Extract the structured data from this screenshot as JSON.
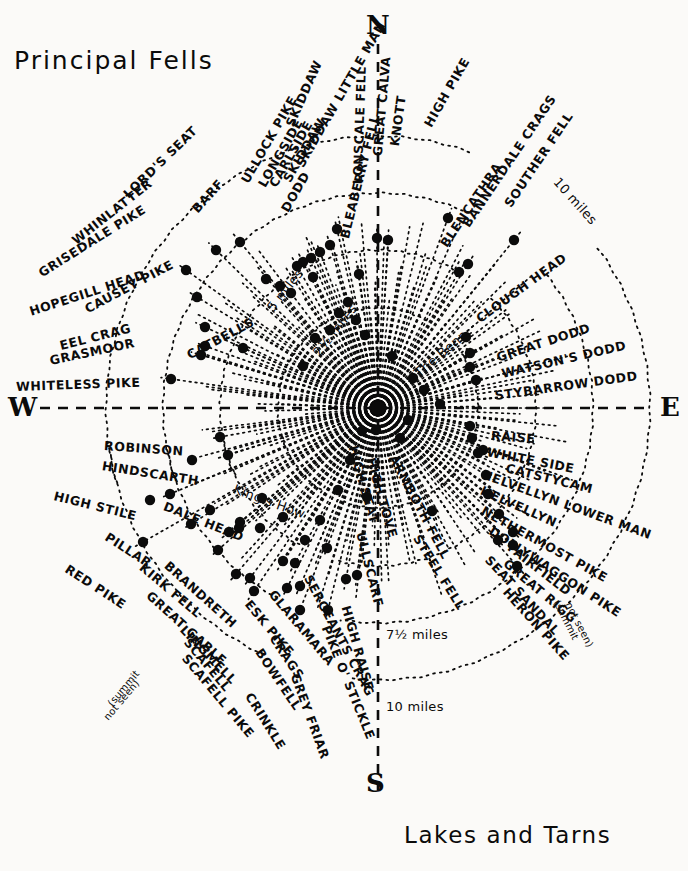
{
  "page": {
    "title": "Principal Fells",
    "caption": "Lakes and Tarns",
    "bg_color": "#fbfaf8",
    "ink_color": "#0b0b0b"
  },
  "cardinals": {
    "north": "N",
    "south": "S",
    "west": "W",
    "east": "E"
  },
  "distance_rings": [
    {
      "label": "2½ miles",
      "value": 2.5,
      "unit": "miles",
      "x": 316,
      "y": 348,
      "rotate": -52
    },
    {
      "label": "5 miles",
      "value": 5,
      "unit": "miles",
      "x": 270,
      "y": 303,
      "rotate": -52
    },
    {
      "label": "7½ miles",
      "value": 7.5,
      "unit": "miles",
      "x": 386,
      "y": 628,
      "rotate": 0
    },
    {
      "label": "10 miles",
      "value": 10,
      "unit": "miles",
      "x": 386,
      "y": 700,
      "rotate": 0
    },
    {
      "label": "10 miles",
      "value": 10,
      "unit": "miles",
      "x": 556,
      "y": 173,
      "rotate": 48
    }
  ],
  "center": {
    "x": 378,
    "y": 408,
    "label": "viewpoint"
  },
  "notes": [
    {
      "text": "(summit",
      "x": 110,
      "y": 700,
      "rotate": -50
    },
    {
      "text": "not seen)",
      "x": 106,
      "y": 714,
      "rotate": -50
    },
    {
      "text": "(summit",
      "x": 556,
      "y": 596,
      "rotate": 63
    },
    {
      "text": "not seen)",
      "x": 568,
      "y": 598,
      "rotate": 63
    }
  ],
  "fells": [
    {
      "name": "SKIDDAW",
      "x": 290,
      "y": 120,
      "rotate": -66,
      "dot": [
        337,
        229
      ]
    },
    {
      "name": "SKIDDAW LITTLE MAN",
      "x": 300,
      "y": 160,
      "rotate": -60,
      "dot": [
        330,
        245
      ]
    },
    {
      "name": "SKIDDAW",
      "x": 287,
      "y": 175,
      "rotate": -60,
      "dot": [
        320,
        252
      ]
    },
    {
      "name": "CARLSIDE",
      "x": 273,
      "y": 180,
      "rotate": -60,
      "dot": [
        311,
        258
      ]
    },
    {
      "name": "LONGSIDE",
      "x": 262,
      "y": 180,
      "rotate": -60,
      "dot": [
        303,
        262
      ]
    },
    {
      "name": "ULLOCK PIKE",
      "x": 245,
      "y": 176,
      "rotate": -60,
      "dot": [
        297,
        266
      ]
    },
    {
      "name": "DODD",
      "x": 285,
      "y": 205,
      "rotate": -60,
      "dot": [
        313,
        277
      ]
    },
    {
      "name": "LONSCALE FELL",
      "x": 358,
      "y": 178,
      "rotate": -88,
      "dot": [
        359,
        274
      ]
    },
    {
      "name": "GREAT CALVA",
      "x": 378,
      "y": 150,
      "rotate": -85,
      "dot": [
        377,
        238
      ]
    },
    {
      "name": "KNOTT",
      "x": 395,
      "y": 140,
      "rotate": -82,
      "dot": [
        388,
        240
      ]
    },
    {
      "name": "HIGH PIKE",
      "x": 428,
      "y": 120,
      "rotate": -60,
      "dot": [
        448,
        218
      ]
    },
    {
      "name": "BLENCATHRA",
      "x": 444,
      "y": 240,
      "rotate": -56,
      "dot": [
        459,
        272
      ]
    },
    {
      "name": "BANNERDALE CRAGS",
      "x": 466,
      "y": 220,
      "rotate": -56,
      "dot": [
        468,
        264
      ]
    },
    {
      "name": "SOUTHER FELL",
      "x": 508,
      "y": 200,
      "rotate": -56,
      "dot": [
        514,
        240
      ]
    },
    {
      "name": "CLOUGH HEAD",
      "x": 478,
      "y": 314,
      "rotate": -36,
      "dot": [
        466,
        337
      ]
    },
    {
      "name": "GREAT DODD",
      "x": 497,
      "y": 352,
      "rotate": -18,
      "dot": [
        470,
        353
      ]
    },
    {
      "name": "WATSON'S DODD",
      "x": 502,
      "y": 368,
      "rotate": -13,
      "dot": [
        470,
        367
      ]
    },
    {
      "name": "STYBARROW DODD",
      "x": 495,
      "y": 390,
      "rotate": -8,
      "dot": [
        476,
        380
      ]
    },
    {
      "name": "RAISE",
      "x": 491,
      "y": 430,
      "rotate": 4,
      "dot": [
        470,
        426
      ]
    },
    {
      "name": "WHITE SIDE",
      "x": 487,
      "y": 446,
      "rotate": 11,
      "dot": [
        472,
        438
      ]
    },
    {
      "name": "CATSTYCAM",
      "x": 506,
      "y": 462,
      "rotate": 14,
      "dot": [
        483,
        450
      ]
    },
    {
      "name": "HELVELLYN LOWER MAN",
      "x": 482,
      "y": 468,
      "rotate": 20,
      "dot": [
        478,
        453
      ]
    },
    {
      "name": "HELVELLYN",
      "x": 481,
      "y": 484,
      "rotate": 24,
      "dot": [
        486,
        475
      ]
    },
    {
      "name": "NETHERMOST PIKE",
      "x": 482,
      "y": 504,
      "rotate": 29,
      "dot": [
        488,
        494
      ]
    },
    {
      "name": "DOLLYWAGGON PIKE",
      "x": 490,
      "y": 524,
      "rotate": 33,
      "dot": [
        499,
        514
      ]
    },
    {
      "name": "FAIRFIELD",
      "x": 509,
      "y": 540,
      "rotate": 38,
      "dot": [
        513,
        532
      ]
    },
    {
      "name": "GREAT RIGG",
      "x": 505,
      "y": 556,
      "rotate": 40,
      "dot": [
        513,
        545
      ]
    },
    {
      "name": "SEAT SANDAL",
      "x": 487,
      "y": 552,
      "rotate": 47,
      "dot": [
        498,
        540
      ]
    },
    {
      "name": "HERON PIKE",
      "x": 505,
      "y": 584,
      "rotate": 48,
      "dot": [
        517,
        566
      ]
    },
    {
      "name": "STEEL FELL",
      "x": 416,
      "y": 530,
      "rotate": 58,
      "dot": [
        432,
        511
      ]
    },
    {
      "name": "HIGH SEAT",
      "x": 352,
      "y": 440,
      "rotate": 74,
      "dot": [
        362,
        431
      ]
    },
    {
      "name": "HIGH TOVE",
      "x": 370,
      "y": 452,
      "rotate": 74,
      "dot": [
        376,
        430
      ]
    },
    {
      "name": "ARMBOTH FELL",
      "x": 392,
      "y": 450,
      "rotate": 62,
      "dot": [
        400,
        438
      ]
    },
    {
      "name": "ULLSCARF",
      "x": 360,
      "y": 526,
      "rotate": 76,
      "dot": [
        367,
        497
      ]
    },
    {
      "name": "HIGH RAISE",
      "x": 345,
      "y": 600,
      "rotate": 74,
      "dot": [
        357,
        575
      ]
    },
    {
      "name": "PIKE O' STICKLE",
      "x": 325,
      "y": 620,
      "rotate": 68,
      "dot": [
        346,
        579
      ]
    },
    {
      "name": "SERGEANTS CRAG",
      "x": 307,
      "y": 570,
      "rotate": 62,
      "dot": [
        327,
        548
      ]
    },
    {
      "name": "CRAGS",
      "x": 272,
      "y": 630,
      "rotate": 56,
      "dot": [
        300,
        586
      ]
    },
    {
      "name": "GREY FRIAR",
      "x": 294,
      "y": 668,
      "rotate": 70,
      "dot": [
        328,
        610
      ]
    },
    {
      "name": "CRINKLE",
      "x": 248,
      "y": 688,
      "rotate": 58,
      "dot": [
        300,
        610
      ]
    },
    {
      "name": "BOWFELL",
      "x": 258,
      "y": 644,
      "rotate": 56,
      "dot": [
        287,
        588
      ]
    },
    {
      "name": "ESK PIKE",
      "x": 247,
      "y": 596,
      "rotate": 50,
      "dot": [
        283,
        561
      ]
    },
    {
      "name": "GLARAMARA",
      "x": 271,
      "y": 586,
      "rotate": 50,
      "dot": [
        295,
        563
      ]
    },
    {
      "name": "SCAFELL PIKE",
      "x": 184,
      "y": 650,
      "rotate": 50,
      "dot": [
        254,
        591
      ]
    },
    {
      "name": "SCAFELL",
      "x": 186,
      "y": 634,
      "rotate": 50,
      "dot": [
        250,
        578
      ]
    },
    {
      "name": "LINGMELL",
      "x": 182,
      "y": 622,
      "rotate": 46,
      "dot": [
        236,
        574
      ]
    },
    {
      "name": "GREAT GABLE",
      "x": 148,
      "y": 588,
      "rotate": 42,
      "dot": [
        218,
        550
      ]
    },
    {
      "name": "BRANDRETH",
      "x": 166,
      "y": 558,
      "rotate": 42,
      "dot": [
        239,
        528
      ]
    },
    {
      "name": "KIRK FELL",
      "x": 141,
      "y": 560,
      "rotate": 40,
      "dot": [
        229,
        532
      ]
    },
    {
      "name": "RED PIKE",
      "x": 66,
      "y": 562,
      "rotate": 33,
      "dot": [
        143,
        542
      ]
    },
    {
      "name": "PILLAR",
      "x": 106,
      "y": 530,
      "rotate": 33,
      "dot": [
        191,
        524
      ]
    },
    {
      "name": "DALE HEAD",
      "x": 164,
      "y": 500,
      "rotate": 22,
      "dot": [
        240,
        522
      ]
    },
    {
      "name": "King's How",
      "x": 234,
      "y": 482,
      "rotate": 20,
      "dot": [
        283,
        517
      ]
    },
    {
      "name": "HIGH STILE",
      "x": 54,
      "y": 490,
      "rotate": 14,
      "dot": [
        170,
        494
      ]
    },
    {
      "name": "HINDSCARTH",
      "x": 102,
      "y": 460,
      "rotate": 9,
      "dot": [
        228,
        455
      ]
    },
    {
      "name": "ROBINSON",
      "x": 104,
      "y": 440,
      "rotate": 4,
      "dot": [
        220,
        437
      ]
    },
    {
      "name": "WHITELESS PIKE",
      "x": 16,
      "y": 381,
      "rotate": -2,
      "dot": [
        171,
        379
      ]
    },
    {
      "name": "GRASMOOR",
      "x": 50,
      "y": 355,
      "rotate": -12,
      "dot": [
        201,
        355
      ]
    },
    {
      "name": "EEL CRAG",
      "x": 60,
      "y": 340,
      "rotate": -14,
      "dot": [
        205,
        346
      ]
    },
    {
      "name": "HOPEGILL HEAD",
      "x": 30,
      "y": 306,
      "rotate": -18,
      "dot": [
        205,
        327
      ]
    },
    {
      "name": "CAUSEY PIKE",
      "x": 86,
      "y": 304,
      "rotate": -28,
      "dot": [
        243,
        348
      ]
    },
    {
      "name": "CATBELLS",
      "x": 188,
      "y": 350,
      "rotate": -28,
      "dot": [
        303,
        366
      ]
    },
    {
      "name": "GRISEDALE PIKE",
      "x": 40,
      "y": 268,
      "rotate": -32,
      "dot": [
        197,
        297
      ]
    },
    {
      "name": "WHINLATTER",
      "x": 74,
      "y": 236,
      "rotate": -38,
      "dot": [
        186,
        270
      ]
    },
    {
      "name": "LORD'S SEAT",
      "x": 126,
      "y": 190,
      "rotate": -44,
      "dot": [
        216,
        250
      ]
    },
    {
      "name": "BARF",
      "x": 195,
      "y": 205,
      "rotate": -48,
      "dot": [
        240,
        242
      ]
    },
    {
      "name": "BLEABERRY FELL",
      "x": 345,
      "y": 232,
      "rotate": -76,
      "dot": [
        348,
        302
      ]
    },
    {
      "name": "The Benn",
      "x": 416,
      "y": 368,
      "rotate": -40,
      "dot": [
        413,
        378
      ]
    }
  ],
  "dots": [
    [
      337,
      229
    ],
    [
      330,
      245
    ],
    [
      320,
      252
    ],
    [
      311,
      258
    ],
    [
      303,
      262
    ],
    [
      297,
      266
    ],
    [
      313,
      277
    ],
    [
      359,
      274
    ],
    [
      377,
      238
    ],
    [
      388,
      240
    ],
    [
      448,
      218
    ],
    [
      459,
      272
    ],
    [
      468,
      264
    ],
    [
      514,
      240
    ],
    [
      466,
      337
    ],
    [
      470,
      353
    ],
    [
      470,
      367
    ],
    [
      476,
      380
    ],
    [
      470,
      426
    ],
    [
      472,
      438
    ],
    [
      483,
      450
    ],
    [
      478,
      453
    ],
    [
      486,
      475
    ],
    [
      488,
      494
    ],
    [
      499,
      514
    ],
    [
      513,
      532
    ],
    [
      513,
      545
    ],
    [
      498,
      540
    ],
    [
      517,
      566
    ],
    [
      432,
      511
    ],
    [
      362,
      431
    ],
    [
      376,
      430
    ],
    [
      400,
      438
    ],
    [
      367,
      497
    ],
    [
      357,
      575
    ],
    [
      346,
      579
    ],
    [
      327,
      548
    ],
    [
      300,
      586
    ],
    [
      328,
      610
    ],
    [
      300,
      610
    ],
    [
      287,
      588
    ],
    [
      283,
      561
    ],
    [
      295,
      563
    ],
    [
      254,
      591
    ],
    [
      250,
      578
    ],
    [
      236,
      574
    ],
    [
      218,
      550
    ],
    [
      239,
      528
    ],
    [
      229,
      532
    ],
    [
      143,
      542
    ],
    [
      191,
      524
    ],
    [
      240,
      522
    ],
    [
      283,
      517
    ],
    [
      170,
      494
    ],
    [
      228,
      455
    ],
    [
      220,
      437
    ],
    [
      171,
      379
    ],
    [
      201,
      355
    ],
    [
      205,
      346
    ],
    [
      205,
      327
    ],
    [
      243,
      348
    ],
    [
      303,
      366
    ],
    [
      197,
      297
    ],
    [
      186,
      270
    ],
    [
      216,
      250
    ],
    [
      240,
      242
    ],
    [
      348,
      302
    ],
    [
      413,
      378
    ],
    [
      266,
      279
    ],
    [
      280,
      286
    ],
    [
      291,
      293
    ],
    [
      339,
      313
    ],
    [
      356,
      320
    ],
    [
      365,
      335
    ],
    [
      392,
      356
    ],
    [
      424,
      390
    ],
    [
      330,
      330
    ],
    [
      315,
      338
    ],
    [
      440,
      404
    ],
    [
      408,
      420
    ],
    [
      350,
      460
    ],
    [
      338,
      490
    ],
    [
      320,
      520
    ],
    [
      305,
      540
    ],
    [
      260,
      528
    ],
    [
      210,
      510
    ],
    [
      150,
      500
    ],
    [
      192,
      460
    ],
    [
      262,
      498
    ]
  ]
}
